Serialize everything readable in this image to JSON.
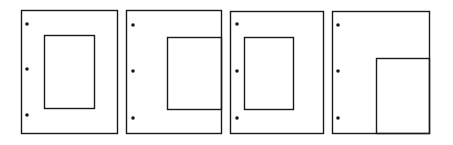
{
  "diagram": {
    "stroke_color": "#1a1a1a",
    "background": "#ffffff",
    "panels": [
      {
        "name": "panel-1-centered-frame",
        "outer": {
          "x": 21,
          "y": 10,
          "w": 96,
          "h": 123
        },
        "inner": {
          "x": 44,
          "y": 35,
          "w": 50,
          "h": 73
        },
        "holes": [
          {
            "x": 27,
            "y": 24
          },
          {
            "x": 27,
            "y": 69
          },
          {
            "x": 27,
            "y": 115
          }
        ]
      },
      {
        "name": "panel-2-frame-bleeds-right",
        "outer": {
          "x": 126,
          "y": 10,
          "w": 95,
          "h": 123
        },
        "inner": {
          "x": 167,
          "y": 37,
          "w": 54,
          "h": 72
        },
        "holes": [
          {
            "x": 133,
            "y": 25
          },
          {
            "x": 133,
            "y": 71
          },
          {
            "x": 133,
            "y": 118
          }
        ]
      },
      {
        "name": "panel-3-centered-frame",
        "outer": {
          "x": 230,
          "y": 11,
          "w": 93,
          "h": 122
        },
        "inner": {
          "x": 244,
          "y": 37,
          "w": 49,
          "h": 72
        },
        "holes": [
          {
            "x": 237,
            "y": 24
          },
          {
            "x": 237,
            "y": 71
          },
          {
            "x": 237,
            "y": 118
          }
        ]
      },
      {
        "name": "panel-4-frame-bottom-right-corner",
        "outer": {
          "x": 332,
          "y": 11,
          "w": 97,
          "h": 122
        },
        "inner": {
          "x": 376,
          "y": 58,
          "w": 53,
          "h": 75
        },
        "holes": [
          {
            "x": 338,
            "y": 25
          },
          {
            "x": 338,
            "y": 71
          },
          {
            "x": 338,
            "y": 118
          }
        ]
      }
    ]
  }
}
